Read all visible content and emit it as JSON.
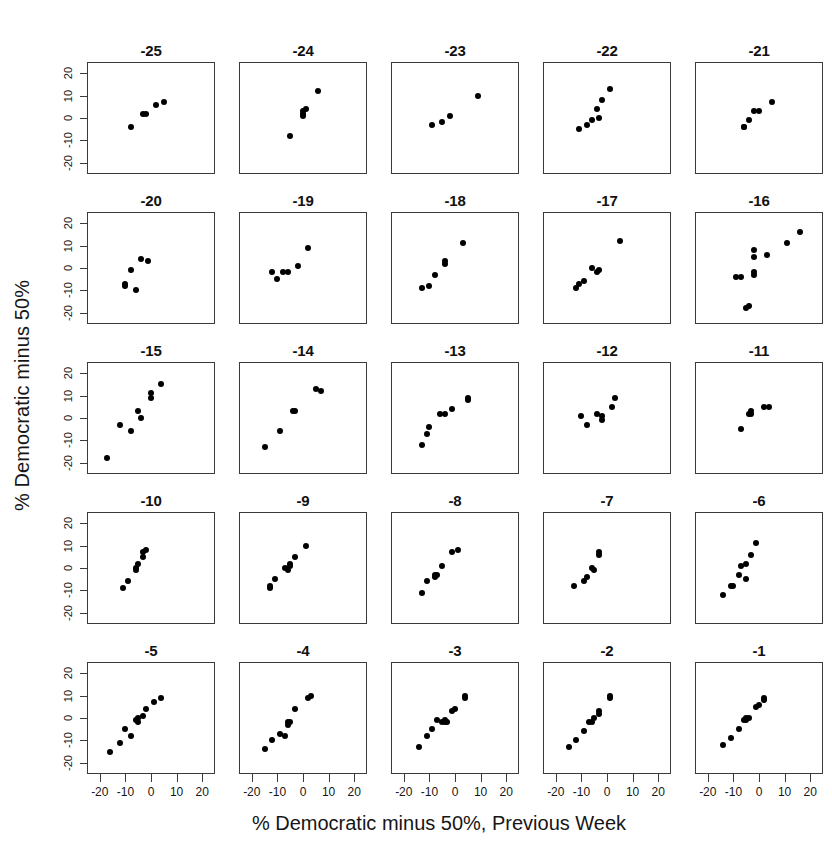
{
  "chart_data": {
    "type": "scatter",
    "title": "",
    "xlabel": "% Democratic minus 50%, Previous Week",
    "ylabel": "% Democratic minus 50%",
    "xlim": [
      -25,
      25
    ],
    "ylim": [
      -25,
      25
    ],
    "xticks": [
      -20,
      -10,
      0,
      10,
      20
    ],
    "yticks": [
      20,
      10,
      0,
      -10,
      -20
    ],
    "xtick_labels": [
      "-20",
      "-10",
      "0",
      "10",
      "20"
    ],
    "ytick_labels": [
      "20",
      "10",
      "0",
      "-10",
      "-20"
    ],
    "grid": false,
    "legend": null,
    "layout": {
      "rows": 5,
      "cols": 5,
      "shared_x": true,
      "shared_y": true
    },
    "point_color": "#000000",
    "panel_border_color": "#3a3a3a",
    "panels": [
      {
        "title": "-25",
        "points": [
          [
            -8,
            -4
          ],
          [
            -3,
            2
          ],
          [
            -2,
            2
          ],
          [
            2,
            6
          ],
          [
            5,
            7
          ]
        ]
      },
      {
        "title": "-24",
        "points": [
          [
            -5,
            -8
          ],
          [
            0,
            1
          ],
          [
            0,
            2
          ],
          [
            0,
            3
          ],
          [
            1,
            4
          ],
          [
            6,
            12
          ]
        ]
      },
      {
        "title": "-23",
        "points": [
          [
            -9,
            -3
          ],
          [
            -5,
            -2
          ],
          [
            -2,
            1
          ],
          [
            9,
            10
          ]
        ]
      },
      {
        "title": "-22",
        "points": [
          [
            -11,
            -5
          ],
          [
            -8,
            -3
          ],
          [
            -6,
            -1
          ],
          [
            -4,
            4
          ],
          [
            -3,
            0
          ],
          [
            -2,
            8
          ],
          [
            1,
            13
          ]
        ]
      },
      {
        "title": "-21",
        "points": [
          [
            -6,
            -4
          ],
          [
            -6,
            -4
          ],
          [
            -4,
            -1
          ],
          [
            -2,
            3
          ],
          [
            0,
            3
          ],
          [
            5,
            7
          ]
        ]
      },
      {
        "title": "-20",
        "points": [
          [
            -10,
            -7
          ],
          [
            -10,
            -8
          ],
          [
            -8,
            -1
          ],
          [
            -6,
            -10
          ],
          [
            -4,
            4
          ],
          [
            -1,
            3
          ]
        ]
      },
      {
        "title": "-19",
        "points": [
          [
            -12,
            -2
          ],
          [
            -10,
            -5
          ],
          [
            -8,
            -2
          ],
          [
            -6,
            -2
          ],
          [
            -2,
            1
          ],
          [
            2,
            9
          ]
        ]
      },
      {
        "title": "-18",
        "points": [
          [
            -13,
            -9
          ],
          [
            -10,
            -8
          ],
          [
            -8,
            -3
          ],
          [
            -4,
            2
          ],
          [
            -4,
            3
          ],
          [
            3,
            11
          ]
        ]
      },
      {
        "title": "-17",
        "points": [
          [
            -12,
            -9
          ],
          [
            -11,
            -7
          ],
          [
            -9,
            -6
          ],
          [
            -6,
            0
          ],
          [
            -4,
            -2
          ],
          [
            -3,
            -1
          ],
          [
            5,
            12
          ]
        ]
      },
      {
        "title": "-16",
        "points": [
          [
            -9,
            -4
          ],
          [
            -7,
            -4
          ],
          [
            -5,
            -18
          ],
          [
            -4,
            -17
          ],
          [
            -2,
            -2
          ],
          [
            -2,
            -3
          ],
          [
            -2,
            5
          ],
          [
            -2,
            8
          ],
          [
            3,
            6
          ],
          [
            11,
            11
          ],
          [
            16,
            16
          ]
        ]
      },
      {
        "title": "-15",
        "points": [
          [
            -17,
            -18
          ],
          [
            -12,
            -3
          ],
          [
            -8,
            -6
          ],
          [
            -5,
            3
          ],
          [
            -4,
            0
          ],
          [
            0,
            9
          ],
          [
            0,
            11
          ],
          [
            4,
            15
          ]
        ]
      },
      {
        "title": "-14",
        "points": [
          [
            -15,
            -13
          ],
          [
            -9,
            -6
          ],
          [
            -4,
            3
          ],
          [
            -3,
            3
          ],
          [
            5,
            13
          ],
          [
            7,
            12
          ]
        ]
      },
      {
        "title": "-13",
        "points": [
          [
            -13,
            -12
          ],
          [
            -11,
            -7
          ],
          [
            -10,
            -4
          ],
          [
            -6,
            2
          ],
          [
            -4,
            2
          ],
          [
            -1,
            4
          ],
          [
            5,
            8
          ],
          [
            5,
            9
          ]
        ]
      },
      {
        "title": "-12",
        "points": [
          [
            -10,
            1
          ],
          [
            -8,
            -3
          ],
          [
            -4,
            2
          ],
          [
            -2,
            1
          ],
          [
            -2,
            -1
          ],
          [
            2,
            5
          ],
          [
            3,
            9
          ]
        ]
      },
      {
        "title": "-11",
        "points": [
          [
            -7,
            -5
          ],
          [
            -4,
            2
          ],
          [
            -3,
            2
          ],
          [
            -3,
            3
          ],
          [
            2,
            5
          ],
          [
            4,
            5
          ]
        ]
      },
      {
        "title": "-10",
        "points": [
          [
            -11,
            -9
          ],
          [
            -9,
            -6
          ],
          [
            -6,
            -1
          ],
          [
            -6,
            0
          ],
          [
            -5,
            2
          ],
          [
            -3,
            5
          ],
          [
            -3,
            7
          ],
          [
            -2,
            8
          ]
        ]
      },
      {
        "title": "-9",
        "points": [
          [
            -13,
            -9
          ],
          [
            -13,
            -8
          ],
          [
            -11,
            -5
          ],
          [
            -7,
            0
          ],
          [
            -6,
            -1
          ],
          [
            -5,
            1
          ],
          [
            -5,
            2
          ],
          [
            -3,
            5
          ],
          [
            1,
            10
          ]
        ]
      },
      {
        "title": "-8",
        "points": [
          [
            -13,
            -11
          ],
          [
            -11,
            -6
          ],
          [
            -8,
            -4
          ],
          [
            -8,
            -3
          ],
          [
            -7,
            -3
          ],
          [
            -5,
            1
          ],
          [
            -1,
            7
          ],
          [
            1,
            8
          ]
        ]
      },
      {
        "title": "-7",
        "points": [
          [
            -13,
            -8
          ],
          [
            -9,
            -6
          ],
          [
            -8,
            -4
          ],
          [
            -6,
            0
          ],
          [
            -5,
            -1
          ],
          [
            -3,
            6
          ],
          [
            -3,
            7
          ]
        ]
      },
      {
        "title": "-6",
        "points": [
          [
            -14,
            -12
          ],
          [
            -11,
            -8
          ],
          [
            -10,
            -8
          ],
          [
            -8,
            -3
          ],
          [
            -7,
            1
          ],
          [
            -5,
            2
          ],
          [
            -5,
            -5
          ],
          [
            -3,
            6
          ],
          [
            -1,
            11
          ]
        ]
      },
      {
        "title": "-5",
        "points": [
          [
            -16,
            -15
          ],
          [
            -12,
            -11
          ],
          [
            -10,
            -5
          ],
          [
            -8,
            -8
          ],
          [
            -6,
            -1
          ],
          [
            -5,
            0
          ],
          [
            -5,
            -2
          ],
          [
            -3,
            1
          ],
          [
            -2,
            4
          ],
          [
            1,
            7
          ],
          [
            4,
            9
          ]
        ]
      },
      {
        "title": "-4",
        "points": [
          [
            -15,
            -14
          ],
          [
            -12,
            -10
          ],
          [
            -9,
            -7
          ],
          [
            -7,
            -8
          ],
          [
            -6,
            -3
          ],
          [
            -6,
            -2
          ],
          [
            -5,
            -2
          ],
          [
            -3,
            4
          ],
          [
            2,
            9
          ],
          [
            3,
            10
          ]
        ]
      },
      {
        "title": "-3",
        "points": [
          [
            -14,
            -13
          ],
          [
            -11,
            -8
          ],
          [
            -9,
            -5
          ],
          [
            -7,
            -1
          ],
          [
            -5,
            -2
          ],
          [
            -4,
            -2
          ],
          [
            -4,
            -1
          ],
          [
            -3,
            -2
          ],
          [
            -1,
            3
          ],
          [
            0,
            4
          ],
          [
            4,
            9
          ],
          [
            4,
            10
          ]
        ]
      },
      {
        "title": "-2",
        "points": [
          [
            -15,
            -13
          ],
          [
            -12,
            -10
          ],
          [
            -9,
            -6
          ],
          [
            -7,
            -2
          ],
          [
            -6,
            -2
          ],
          [
            -5,
            0
          ],
          [
            -3,
            2
          ],
          [
            -3,
            3
          ],
          [
            1,
            9
          ],
          [
            1,
            10
          ]
        ]
      },
      {
        "title": "-1",
        "points": [
          [
            -14,
            -12
          ],
          [
            -11,
            -9
          ],
          [
            -8,
            -5
          ],
          [
            -6,
            -1
          ],
          [
            -5,
            -1
          ],
          [
            -5,
            0
          ],
          [
            -4,
            0
          ],
          [
            -1,
            5
          ],
          [
            0,
            6
          ],
          [
            2,
            8
          ],
          [
            2,
            9
          ]
        ]
      }
    ]
  }
}
